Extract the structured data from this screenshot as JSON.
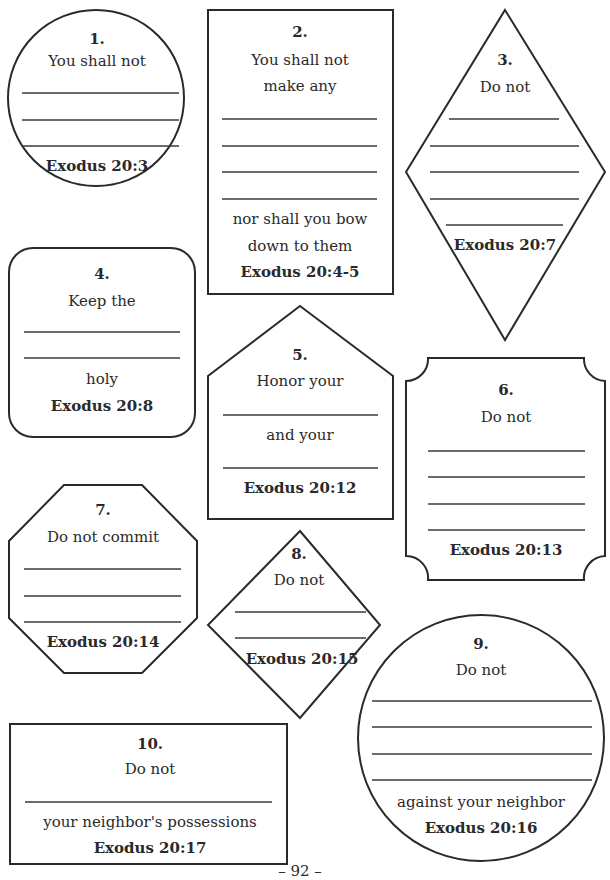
{
  "page": {
    "number_label": "– 92 –"
  },
  "commandments": [
    {
      "number": "1.",
      "shape": "circle",
      "prompt": [
        "You shall not"
      ],
      "blank_lines": 3,
      "after": [],
      "reference": "Exodus 20:3"
    },
    {
      "number": "2.",
      "shape": "rectangle",
      "prompt": [
        "You shall not",
        "make any"
      ],
      "blank_lines": 4,
      "after": [
        "nor shall you bow",
        "down to them"
      ],
      "reference": "Exodus 20:4-5"
    },
    {
      "number": "3.",
      "shape": "diamond",
      "prompt": [
        "Do not"
      ],
      "blank_lines": 5,
      "after": [],
      "reference": "Exodus 20:7"
    },
    {
      "number": "4.",
      "shape": "rounded-rectangle",
      "prompt": [
        "Keep the"
      ],
      "blank_lines": 2,
      "after": [
        "holy"
      ],
      "reference": "Exodus 20:8"
    },
    {
      "number": "5.",
      "shape": "house",
      "prompt": [
        "Honor your"
      ],
      "blank_lines": 2,
      "middle": "and your",
      "after": [],
      "reference": "Exodus 20:12"
    },
    {
      "number": "6.",
      "shape": "scalloped-rectangle",
      "prompt": [
        "Do not"
      ],
      "blank_lines": 4,
      "after": [],
      "reference": "Exodus 20:13"
    },
    {
      "number": "7.",
      "shape": "octagon",
      "prompt": [
        "Do not commit"
      ],
      "blank_lines": 3,
      "after": [],
      "reference": "Exodus 20:14"
    },
    {
      "number": "8.",
      "shape": "diamond",
      "prompt": [
        "Do not"
      ],
      "blank_lines": 2,
      "after": [],
      "reference": "Exodus 20:15"
    },
    {
      "number": "9.",
      "shape": "circle",
      "prompt": [
        "Do not"
      ],
      "blank_lines": 4,
      "after": [
        "against your neighbor"
      ],
      "reference": "Exodus 20:16"
    },
    {
      "number": "10.",
      "shape": "rectangle",
      "prompt": [
        "Do not"
      ],
      "blank_lines": 1,
      "after": [
        "your neighbor's possessions"
      ],
      "reference": "Exodus 20:17"
    }
  ]
}
